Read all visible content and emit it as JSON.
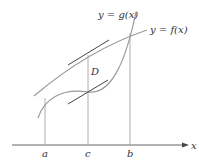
{
  "diagram": {
    "curves": {
      "g_label": "y = g(x)",
      "f_label": "y = f(x)"
    },
    "region_label": "D",
    "axis": {
      "x_label": "x",
      "ticks": [
        "a",
        "c",
        "b"
      ]
    },
    "colors": {
      "curve": "#9a9a9a",
      "tangent": "#444444",
      "axis": "#555555",
      "text": "#333333"
    }
  }
}
